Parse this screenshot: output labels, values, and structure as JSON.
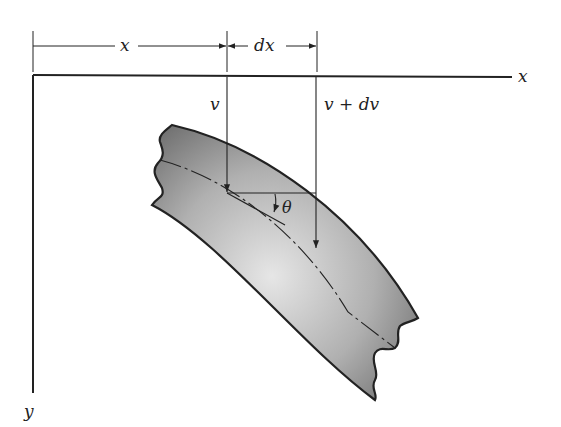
{
  "diagram": {
    "labels": {
      "x_dim": "x",
      "dx_dim": "dx",
      "x_axis": "x",
      "y_axis": "y",
      "v": "v",
      "v_plus_dv": "v + dv",
      "theta": "θ"
    },
    "colors": {
      "line": "#222222",
      "beam_dark": "#6e6e6e",
      "beam_light": "#e2e2e2"
    }
  }
}
